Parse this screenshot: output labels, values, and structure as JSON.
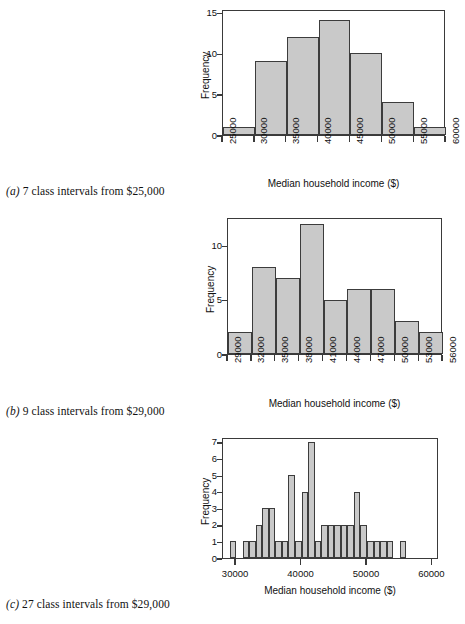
{
  "figure": {
    "title": "",
    "bar_fill": "#c9c9c9",
    "bar_stroke": "#3c3c3c",
    "axis_color": "#3a3a3a",
    "background": "#ffffff"
  },
  "panels": [
    {
      "id": "a",
      "caption_label": "(a)",
      "caption_text": " 7 class intervals from $25,000",
      "xlabel": "Median household income ($)",
      "ylabel": "Frequency"
    },
    {
      "id": "b",
      "caption_label": "(b)",
      "caption_text": " 9 class intervals from $29,000",
      "xlabel": "Median household income ($)",
      "ylabel": "Frequency"
    },
    {
      "id": "c",
      "caption_label": "(c)",
      "caption_text": " 27 class intervals from $29,000",
      "xlabel": "Median household income ($)",
      "ylabel": "Frequency"
    }
  ],
  "chart_data": [
    {
      "type": "bar",
      "panel": "a",
      "title": "(a) 7 class intervals from $25,000",
      "xlabel": "Median household income ($)",
      "ylabel": "Frequency",
      "bin_width": 5000,
      "bin_edges": [
        25000,
        30000,
        35000,
        40000,
        45000,
        50000,
        55000,
        60000
      ],
      "categories": [
        "25000-30000",
        "30000-35000",
        "35000-40000",
        "40000-45000",
        "45000-50000",
        "50000-55000",
        "55000-60000"
      ],
      "values": [
        1,
        9,
        12,
        14,
        10,
        4,
        1
      ],
      "xtick_labels": [
        "25000",
        "30000",
        "35000",
        "40000",
        "45000",
        "50000",
        "55000",
        "60000"
      ],
      "xtick_values": [
        25000,
        30000,
        35000,
        40000,
        45000,
        50000,
        55000,
        60000
      ],
      "ytick_labels": [
        "0",
        "5",
        "10",
        "15"
      ],
      "ytick_values": [
        0,
        5,
        10,
        15
      ],
      "xlim": [
        25000,
        60000
      ],
      "ylim": [
        0,
        15.4
      ],
      "grid": false,
      "legend": null
    },
    {
      "type": "bar",
      "panel": "b",
      "title": "(b) 9 class intervals from $29,000",
      "xlabel": "Median household income ($)",
      "ylabel": "Frequency",
      "bin_width": 3000,
      "bin_edges": [
        29000,
        32000,
        35000,
        38000,
        41000,
        44000,
        47000,
        50000,
        53000,
        56000
      ],
      "categories": [
        "29000-32000",
        "32000-35000",
        "35000-38000",
        "38000-41000",
        "41000-44000",
        "44000-47000",
        "47000-50000",
        "50000-53000",
        "53000-56000"
      ],
      "values": [
        2,
        8,
        7,
        12,
        5,
        6,
        6,
        3,
        2
      ],
      "xtick_labels": [
        "29000",
        "32000",
        "35000",
        "38000",
        "41000",
        "44000",
        "47000",
        "50000",
        "53000",
        "56000"
      ],
      "xtick_values": [
        29000,
        32000,
        35000,
        38000,
        41000,
        44000,
        47000,
        50000,
        53000,
        56000
      ],
      "ytick_labels": [
        "0",
        "5",
        "10"
      ],
      "ytick_values": [
        0,
        5,
        10
      ],
      "xlim": [
        29000,
        56000
      ],
      "ylim": [
        0,
        12.6
      ],
      "grid": false,
      "legend": null
    },
    {
      "type": "bar",
      "panel": "c",
      "title": "(c) 27 class intervals from $29,000",
      "xlabel": "Median household income ($)",
      "ylabel": "Frequency",
      "bin_width": 1000,
      "bin_start": 29000,
      "bin_end": 56000,
      "categories": [
        "29000",
        "30000",
        "31000",
        "32000",
        "33000",
        "34000",
        "35000",
        "36000",
        "37000",
        "38000",
        "39000",
        "40000",
        "41000",
        "42000",
        "43000",
        "44000",
        "45000",
        "46000",
        "47000",
        "48000",
        "49000",
        "50000",
        "51000",
        "52000",
        "53000",
        "54000",
        "55000"
      ],
      "values": [
        1,
        0,
        1,
        1,
        2,
        3,
        3,
        1,
        1,
        5,
        1,
        4,
        7,
        1,
        2,
        2,
        2,
        2,
        2,
        4,
        2,
        1,
        1,
        1,
        1,
        0,
        1
      ],
      "xtick_labels": [
        "30000",
        "40000",
        "50000",
        "60000"
      ],
      "xtick_values": [
        30000,
        40000,
        50000,
        60000
      ],
      "ytick_labels": [
        "0",
        "1",
        "2",
        "3",
        "4",
        "5",
        "6",
        "7"
      ],
      "ytick_values": [
        0,
        1,
        2,
        3,
        4,
        5,
        6,
        7
      ],
      "xlim": [
        28000,
        61000
      ],
      "ylim": [
        0,
        7.3
      ],
      "grid": false,
      "legend": null
    }
  ]
}
